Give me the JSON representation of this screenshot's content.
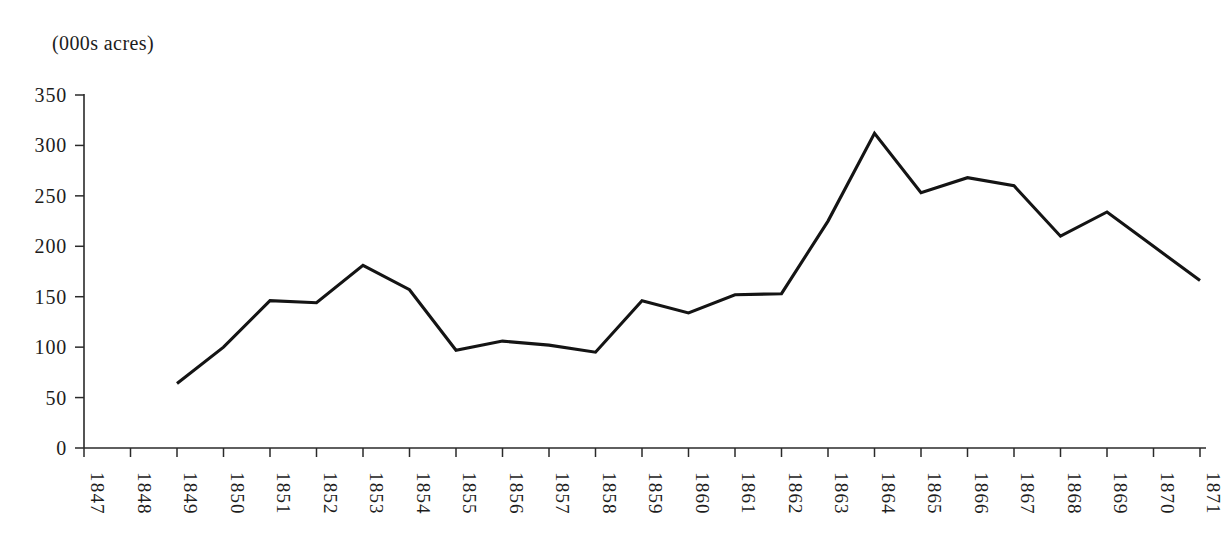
{
  "chart_data": {
    "type": "line",
    "title": "",
    "unit_label": "(000s acres)",
    "xlabel": "",
    "ylabel": "",
    "ylim": [
      0,
      350
    ],
    "ytick_labels": [
      "0",
      "50",
      "100",
      "150",
      "200",
      "250",
      "300",
      "350"
    ],
    "ytick_values": [
      0,
      50,
      100,
      150,
      200,
      250,
      300,
      350
    ],
    "grid": false,
    "legend": "none",
    "categories": [
      "1847",
      "1848",
      "1849",
      "1850",
      "1851",
      "1852",
      "1853",
      "1854",
      "1855",
      "1856",
      "1857",
      "1858",
      "1859",
      "1860",
      "1861",
      "1862",
      "1863",
      "1864",
      "1865",
      "1866",
      "1867",
      "1868",
      "1869",
      "1870",
      "1871"
    ],
    "series": [
      {
        "name": "acreage",
        "values": [
          null,
          null,
          64,
          100,
          146,
          144,
          181,
          157,
          97,
          106,
          102,
          95,
          146,
          134,
          152,
          153,
          225,
          312,
          253,
          268,
          260,
          210,
          234,
          200,
          166
        ]
      }
    ]
  },
  "plot_geometry": {
    "x_origin": 84,
    "x_last": 1200,
    "y_zero": 448,
    "y_top": 95,
    "y_max_value": 350
  }
}
